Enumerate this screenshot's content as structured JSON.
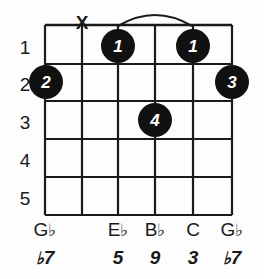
{
  "diagram": {
    "type": "guitar-chord-diagram",
    "title": "",
    "background_color": "#fdfdfd",
    "line_color": "#1a1a1a",
    "dot_color": "#111111",
    "dot_text_color": "#ffffff",
    "string_count": 6,
    "fret_count": 5,
    "fret_numbers": [
      "1",
      "2",
      "3",
      "4",
      "5"
    ],
    "strings": [
      {
        "index": 1,
        "note": "G",
        "note_accidental": "♭",
        "interval": "♭7",
        "interval_number": "7",
        "interval_accidental": "♭",
        "marker": "dot",
        "fret": 2,
        "finger": "2"
      },
      {
        "index": 2,
        "note": "",
        "note_accidental": "",
        "interval": "",
        "interval_number": "",
        "interval_accidental": "",
        "marker": "mute",
        "mute_symbol": "X",
        "fret": 0,
        "finger": ""
      },
      {
        "index": 3,
        "note": "E",
        "note_accidental": "♭",
        "interval": "5",
        "interval_number": "5",
        "interval_accidental": "",
        "marker": "dot",
        "fret": 1,
        "finger": "1"
      },
      {
        "index": 4,
        "note": "B",
        "note_accidental": "♭",
        "interval": "9",
        "interval_number": "9",
        "interval_accidental": "",
        "marker": "dot",
        "fret": 3,
        "finger": "4"
      },
      {
        "index": 5,
        "note": "C",
        "note_accidental": "",
        "interval": "3",
        "interval_number": "3",
        "interval_accidental": "",
        "marker": "dot",
        "fret": 1,
        "finger": "1"
      },
      {
        "index": 6,
        "note": "G",
        "note_accidental": "♭",
        "interval": "♭7",
        "interval_number": "7",
        "interval_accidental": "♭",
        "marker": "dot",
        "fret": 2,
        "finger": "3"
      }
    ],
    "barre": {
      "present": true,
      "finger": "1",
      "fret": 1,
      "from_string": 3,
      "to_string": 5
    }
  }
}
